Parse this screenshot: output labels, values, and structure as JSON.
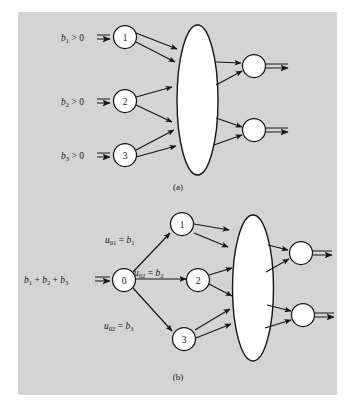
{
  "figure": {
    "background_color": "#ffffff",
    "panel_color": "#d4d4d4",
    "ink_color": "#16161a",
    "node_fill": "#ffffff"
  },
  "panel_a": {
    "caption": "(a)",
    "input_labels": [
      {
        "id": "b1-gt-0",
        "base": "b",
        "sub": "1",
        "rel": " > 0"
      },
      {
        "id": "b2-gt-0",
        "base": "b",
        "sub": "2",
        "rel": " > 0"
      },
      {
        "id": "b3-gt-0",
        "base": "b",
        "sub": "3",
        "rel": " > 0"
      }
    ],
    "source_nodes": [
      "1",
      "2",
      "3"
    ],
    "sink_nodes": [
      "",
      ""
    ],
    "cloud": "network-cloud"
  },
  "panel_b": {
    "caption": "(b)",
    "input_label": {
      "id": "b-sum",
      "terms": [
        "b",
        "b",
        "b"
      ],
      "subs": [
        "1",
        "2",
        "3"
      ],
      "plus": " + "
    },
    "super_source": "0",
    "arc_labels": [
      {
        "id": "u01-eq-b1",
        "var": "u",
        "var_sub": "01",
        "eq": " = ",
        "rhs": "b",
        "rhs_sub": "1"
      },
      {
        "id": "u02-eq-b2",
        "var": "u",
        "var_sub": "02",
        "eq": " = ",
        "rhs": "b",
        "rhs_sub": "2"
      },
      {
        "id": "u02-eq-b3",
        "var": "u",
        "var_sub": "02",
        "eq": " = ",
        "rhs": "b",
        "rhs_sub": "3"
      }
    ],
    "source_nodes": [
      "1",
      "2",
      "3"
    ],
    "sink_nodes": [
      "",
      ""
    ],
    "cloud": "network-cloud"
  }
}
